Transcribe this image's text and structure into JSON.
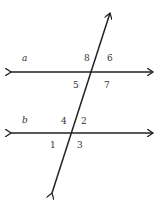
{
  "diagram": {
    "type": "parallel-lines-transversal",
    "lines": {
      "a": "a",
      "b": "b"
    },
    "angles": {
      "top_intersection": {
        "upper_left": "8",
        "upper_right": "6",
        "lower_left": "5",
        "lower_right": "7"
      },
      "bottom_intersection": {
        "upper_left": "4",
        "upper_right": "2",
        "lower_left": "1",
        "lower_right": "3"
      }
    },
    "stroke_color": "#222222"
  }
}
